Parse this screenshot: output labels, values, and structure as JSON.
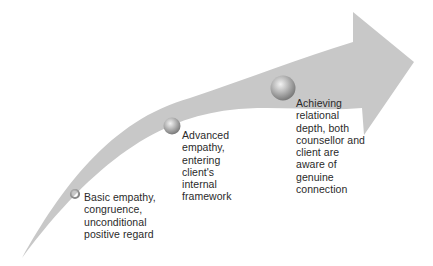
{
  "diagram": {
    "type": "curved-progress-arrow",
    "arrow_color": "#c8c8c8",
    "stages": [
      {
        "id": "stage-1",
        "label": "Basic empathy,\ncongruence,\nunconditional\npositive regard",
        "marker": "small-ring"
      },
      {
        "id": "stage-2",
        "label": "Advanced\nempathy,\nentering\nclient's\ninternal\nframework",
        "marker": "medium-sphere"
      },
      {
        "id": "stage-3",
        "label": "Achieving\nrelational\ndepth, both\ncounsellor and\nclient are\naware of\ngenuine\nconnection",
        "marker": "large-sphere"
      }
    ]
  }
}
